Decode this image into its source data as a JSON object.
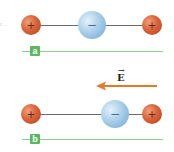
{
  "diagram": {
    "edge_text": "r...",
    "colors": {
      "positive_charge": "#d9623a",
      "negative_charge": "#a9cfe9",
      "rod": "#6b6b6b",
      "axis_line": "#8ccf92",
      "label_badge": "#5cb85c",
      "field_arrow": "#e8772e"
    },
    "panels": [
      {
        "label": "a",
        "charges": [
          {
            "sign": "+",
            "symbol": "+",
            "type": "positive"
          },
          {
            "sign": "-",
            "symbol": "−",
            "type": "negative"
          },
          {
            "sign": "+",
            "symbol": "+",
            "type": "positive"
          }
        ]
      },
      {
        "label": "b",
        "charges": [
          {
            "sign": "+",
            "symbol": "+",
            "type": "positive"
          },
          {
            "sign": "-",
            "symbol": "−",
            "type": "negative"
          },
          {
            "sign": "+",
            "symbol": "+",
            "type": "positive"
          }
        ]
      }
    ],
    "field": {
      "label": "E",
      "vector_mark": "→",
      "direction": "left"
    }
  }
}
